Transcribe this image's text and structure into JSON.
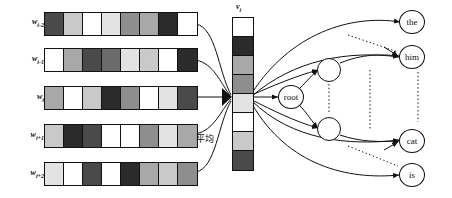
{
  "diagram": {
    "average_annotation": "平均",
    "palette": {
      "white": "#ffffff",
      "near_white": "#f2f2f2",
      "very_light": "#e3e3e3",
      "light_gray": "#c9c9c9",
      "gray": "#a8a8a8",
      "medium_gray": "#8e8e8e",
      "dark_gray": "#6b6b6b",
      "dark": "#4a4a4a",
      "very_dark": "#2b2b2b",
      "outline": "#111111"
    },
    "context_rows": [
      {
        "label": "w",
        "subscript": "i-2",
        "cells": [
          "#4a4a4a",
          "#c9c9c9",
          "#ffffff",
          "#e3e3e3",
          "#8e8e8e",
          "#a8a8a8",
          "#2b2b2b",
          "#ffffff"
        ]
      },
      {
        "label": "w",
        "subscript": "i-1",
        "cells": [
          "#ffffff",
          "#a8a8a8",
          "#4a4a4a",
          "#6b6b6b",
          "#e3e3e3",
          "#c9c9c9",
          "#ffffff",
          "#2b2b2b"
        ]
      },
      {
        "label": "w",
        "subscript": "i",
        "cells": [
          "#a8a8a8",
          "#ffffff",
          "#c9c9c9",
          "#2b2b2b",
          "#8e8e8e",
          "#ffffff",
          "#e3e3e3",
          "#4a4a4a"
        ]
      },
      {
        "label": "w",
        "subscript": "i+1",
        "cells": [
          "#c9c9c9",
          "#2b2b2b",
          "#4a4a4a",
          "#ffffff",
          "#ffffff",
          "#8e8e8e",
          "#e3e3e3",
          "#a8a8a8"
        ]
      },
      {
        "label": "w",
        "subscript": "i+2",
        "cells": [
          "#e3e3e3",
          "#ffffff",
          "#4a4a4a",
          "#ffffff",
          "#2b2b2b",
          "#a8a8a8",
          "#c9c9c9",
          "#8e8e8e"
        ]
      }
    ],
    "projection_vector": {
      "label": "v",
      "subscript": "i",
      "cells": [
        "#ffffff",
        "#2b2b2b",
        "#a8a8a8",
        "#8e8e8e",
        "#e3e3e3",
        "#ffffff",
        "#c9c9c9",
        "#4a4a4a"
      ]
    },
    "tree": {
      "root": {
        "label": "root"
      },
      "internal_nodes": [
        {
          "label": ""
        },
        {
          "label": ""
        }
      ],
      "leaves": [
        {
          "label": "the"
        },
        {
          "label": "him"
        },
        {
          "label": "cat"
        },
        {
          "label": "is"
        }
      ],
      "ellipsis_count": 3
    }
  }
}
